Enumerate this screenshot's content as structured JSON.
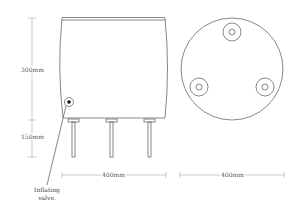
{
  "diagram": {
    "title": "",
    "side_view": {
      "height_body_label": "300mm",
      "height_legs_label": "150mm",
      "width_label": "400mm",
      "valve_label_line1": "Inflating",
      "valve_label_line2": "valve."
    },
    "top_view": {
      "width_label": "400mm",
      "holes": 3
    },
    "colors": {
      "line": "#6a6a6a",
      "dim_line": "#aaaaaa",
      "background": "#ffffff"
    }
  }
}
